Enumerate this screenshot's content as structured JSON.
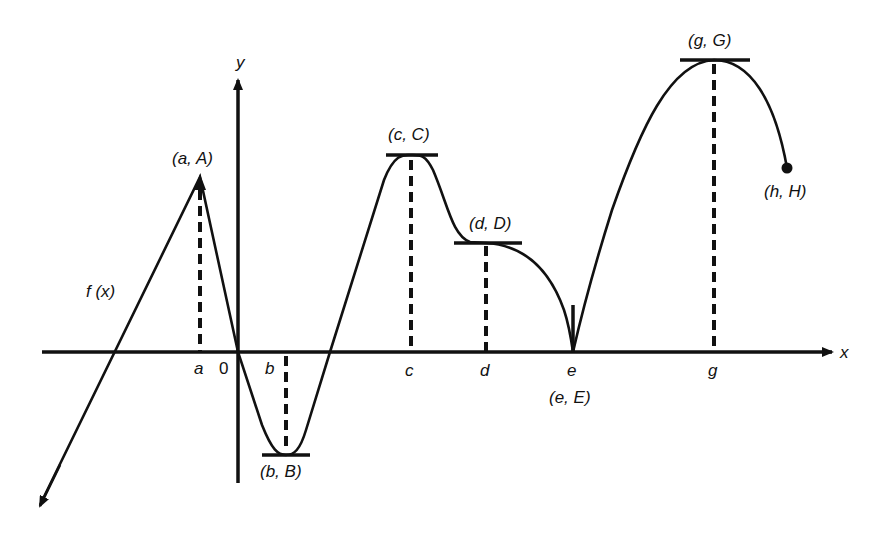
{
  "diagram": {
    "function_label": "f (x)",
    "axes": {
      "x_label": "x",
      "y_label": "y",
      "origin_label": "0"
    },
    "x_ticks": [
      "a",
      "b",
      "c",
      "d",
      "e",
      "g"
    ],
    "points": [
      {
        "id": "a",
        "label": "(a, A)",
        "type": "corner maximum"
      },
      {
        "id": "b",
        "label": "(b, B)",
        "type": "minimum, horizontal tangent"
      },
      {
        "id": "c",
        "label": "(c, C)",
        "type": "maximum, horizontal tangent"
      },
      {
        "id": "d",
        "label": "(d, D)",
        "type": "horizontal tangent (inflection)"
      },
      {
        "id": "e",
        "label": "(e, E)",
        "type": "cusp, vertical tangent"
      },
      {
        "id": "g",
        "label": "(g, G)",
        "type": "maximum, horizontal tangent"
      },
      {
        "id": "h",
        "label": "(h, H)",
        "type": "endpoint"
      }
    ],
    "colors": {
      "stroke": "#111111",
      "background": "#ffffff"
    }
  }
}
